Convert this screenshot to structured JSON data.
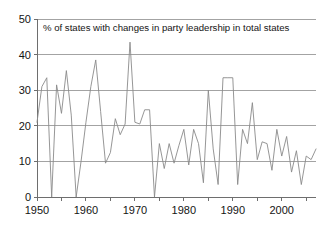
{
  "chart_data": {
    "type": "line",
    "title": "% of states with changes in party leadership in total states",
    "xlabel": "",
    "ylabel": "",
    "xlim": [
      1950,
      2007
    ],
    "ylim": [
      0,
      50
    ],
    "grid": true,
    "legend": false,
    "legend_position": "none",
    "y_ticks": [
      0,
      10,
      20,
      30,
      40,
      50
    ],
    "y_tick_labels": [
      "0",
      "10",
      "20",
      "30",
      "40",
      "50"
    ],
    "x_ticks": [
      1950,
      1955,
      1960,
      1965,
      1970,
      1975,
      1980,
      1985,
      1990,
      1995,
      2000,
      2005
    ],
    "x_tick_labels": [
      "1950",
      "",
      "1960",
      "",
      "1970",
      "",
      "1980",
      "",
      "1990",
      "",
      "2000",
      ""
    ],
    "x_major_labels": [
      1950,
      1960,
      1970,
      1980,
      1990,
      2000
    ],
    "series": [
      {
        "name": "% of states with changes in party leadership",
        "color": "#8a8a8a",
        "x": [
          1950,
          1951,
          1952,
          1953,
          1954,
          1955,
          1956,
          1957,
          1958,
          1959,
          1960,
          1961,
          1962,
          1963,
          1964,
          1965,
          1966,
          1967,
          1968,
          1969,
          1970,
          1971,
          1972,
          1973,
          1974,
          1975,
          1976,
          1977,
          1978,
          1979,
          1980,
          1981,
          1982,
          1983,
          1984,
          1985,
          1986,
          1987,
          1988,
          1989,
          1990,
          1991,
          1992,
          1993,
          1994,
          1995,
          1996,
          1997,
          1998,
          1999,
          2000,
          2001,
          2002,
          2003,
          2004,
          2005,
          2006,
          2007
        ],
        "values": [
          21,
          31,
          33.5,
          0,
          31.5,
          23.5,
          35.5,
          23,
          0,
          10,
          21,
          31,
          38.5,
          24,
          9.5,
          12.5,
          22,
          17.5,
          20.5,
          43.5,
          21,
          20.5,
          24.5,
          24.5,
          0,
          15,
          8,
          15,
          9.5,
          14.5,
          19,
          9,
          19,
          15,
          4,
          30,
          13.5,
          3.5,
          33.5,
          33.5,
          33.5,
          3.5,
          19,
          15,
          26.5,
          10.5,
          15.5,
          15,
          7.5,
          19,
          11.5,
          17,
          7,
          13,
          3.5,
          11.5,
          10.5,
          13.5
        ]
      }
    ]
  },
  "axes": {
    "y_axis_name": "y-axis",
    "x_axis_name": "x-axis"
  }
}
